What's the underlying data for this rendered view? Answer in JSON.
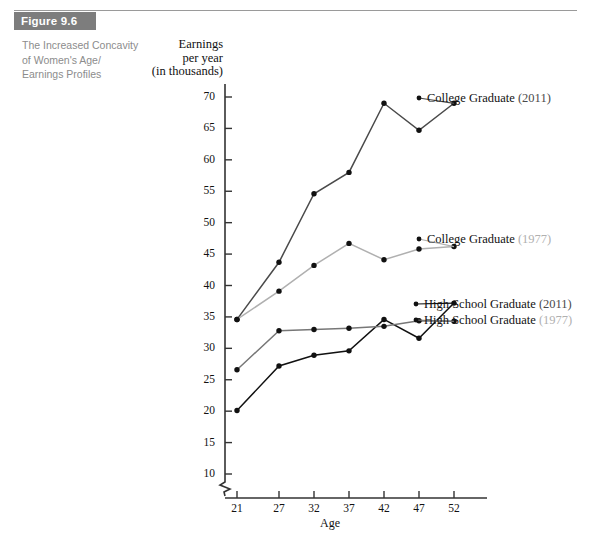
{
  "figure": {
    "badge": "Figure 9.6",
    "caption_lines": [
      "The Increased Concavity",
      "of Women's Age/",
      "Earnings Profiles"
    ]
  },
  "axis_title_lines": [
    "Earnings",
    "per year",
    "(in thousands)"
  ],
  "colors": {
    "badge_bg": "#7d7d7d",
    "caption_text": "#8c8c8c",
    "series_2011": "#4a4a4a",
    "series_1977": "#b0b0b0",
    "series_hs_2011": "#111111",
    "series_hs_1977": "#777777",
    "axis": "#333333"
  },
  "legend": [
    {
      "name": "college-graduate-2011",
      "text": "College Graduate ",
      "year": "(2011)",
      "year_class": "yr-2011"
    },
    {
      "name": "college-graduate-1977",
      "text": "College Graduate ",
      "year": "(1977)",
      "year_class": "yr-1977"
    },
    {
      "name": "high-school-graduate-2011",
      "text": "High School Graduate ",
      "year": "(2011)",
      "year_class": "yr-2011"
    },
    {
      "name": "high-school-graduate-1977",
      "text": "High School Graduate ",
      "year": "(1977)",
      "year_class": "yr-1977"
    }
  ],
  "chart_data": {
    "type": "line",
    "xlabel": "Age",
    "ylabel": "Earnings per year (in thousands)",
    "x": [
      21,
      27,
      32,
      37,
      42,
      47,
      52
    ],
    "xticklabels": [
      "21",
      "27",
      "32",
      "37",
      "42",
      "47",
      "52"
    ],
    "yticks": [
      10,
      15,
      20,
      25,
      30,
      35,
      40,
      45,
      50,
      55,
      60,
      65,
      70
    ],
    "yticklabels": [
      "10",
      "15",
      "20",
      "25",
      "30",
      "35",
      "40",
      "45",
      "50",
      "55",
      "60",
      "65",
      "70"
    ],
    "ylim": [
      7,
      72
    ],
    "xlim": [
      17,
      60
    ],
    "axis_break": true,
    "grid": false,
    "legend_position": "right-inline",
    "markers": "filled-circle",
    "series": [
      {
        "name": "College Graduate (2011)",
        "color": "#4a4a4a",
        "values": [
          34.6,
          43.7,
          54.6,
          58.0,
          69.0,
          64.7,
          69.0
        ]
      },
      {
        "name": "College Graduate (1977)",
        "color": "#b0b0b0",
        "values": [
          34.6,
          39.1,
          43.2,
          46.7,
          44.1,
          45.8,
          46.2
        ]
      },
      {
        "name": "High School Graduate (2011)",
        "color": "#111111",
        "values": [
          20.1,
          27.2,
          28.9,
          29.6,
          34.6,
          31.6,
          37.2
        ]
      },
      {
        "name": "High School Graduate (1977)",
        "color": "#777777",
        "values": [
          26.6,
          32.8,
          33.0,
          33.2,
          33.5,
          34.4,
          34.3
        ]
      }
    ]
  }
}
